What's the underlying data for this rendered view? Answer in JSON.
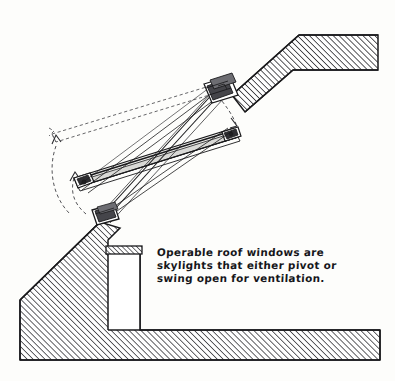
{
  "figure": {
    "caption_lines": [
      "Operable roof windows are",
      "skylights that either pivot or",
      "swing open for ventilation."
    ],
    "colors": {
      "ink": "#1a1a1c",
      "hatch": "#2a2a2e",
      "paper": "#fdfdfb",
      "sash_fill": "#f2f2f0",
      "hardware": "#3a3a3e"
    },
    "elements": [
      {
        "name": "upper-roof-section",
        "label": "Upper roof assembly, hatched section cut"
      },
      {
        "name": "lower-roof-section",
        "label": "Lower roof and wall wedge, hatched section cut"
      },
      {
        "name": "light-shaft",
        "label": "Interior light shaft opening"
      },
      {
        "name": "skylight-sash-open",
        "label": "Roof window sash shown pivoted open"
      },
      {
        "name": "skylight-sash-closed-ghost",
        "label": "Sash closed position, dashed ghost outline"
      },
      {
        "name": "swing-arc",
        "label": "Dashed arc indicating swing of sash"
      },
      {
        "name": "head-jamb-block",
        "label": "Head jamb hardware block"
      },
      {
        "name": "sill-block",
        "label": "Sill hardware block"
      },
      {
        "name": "pivot-hardware",
        "label": "Pivot hinge hardware"
      }
    ]
  }
}
